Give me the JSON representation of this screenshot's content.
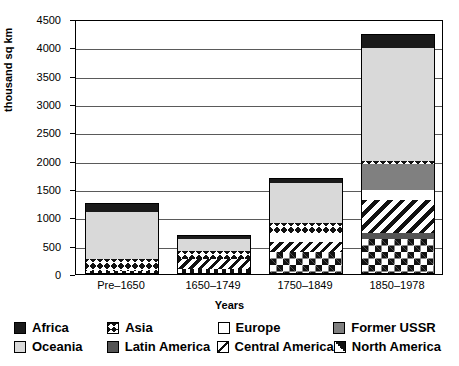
{
  "chart_data": {
    "type": "bar",
    "variant": "stacked",
    "title": "",
    "xlabel": "Years",
    "ylabel": "thousand sq km",
    "categories": [
      "Pre–1650",
      "1650–1749",
      "1750–1849",
      "1850–1978"
    ],
    "ylim": [
      0,
      4500
    ],
    "yticks": [
      0,
      500,
      1000,
      1500,
      2000,
      2500,
      3000,
      3500,
      4000,
      4500
    ],
    "ytick_labels": [
      "0",
      "500",
      "1000",
      "1500",
      "2000",
      "2500",
      "3000",
      "3500",
      "4000",
      "4500"
    ],
    "grid": true,
    "grid_axis": "y",
    "legend_position": "bottom",
    "series": [
      {
        "name": "North America",
        "pattern": "diamond-lattice",
        "values": [
          60,
          80,
          390,
          620
        ]
      },
      {
        "name": "Latin America",
        "pattern": "dark-gray-solid",
        "values": [
          0,
          0,
          0,
          110
        ]
      },
      {
        "name": "Central America",
        "pattern": "diagonal-stripes",
        "values": [
          0,
          190,
          170,
          570
        ]
      },
      {
        "name": "Europe",
        "pattern": "white-solid",
        "values": [
          0,
          0,
          150,
          180
        ]
      },
      {
        "name": "Former USSR",
        "pattern": "mid-gray-solid",
        "values": [
          0,
          0,
          0,
          460
        ]
      },
      {
        "name": "Asia",
        "pattern": "bowtie-chain",
        "values": [
          210,
          140,
          190,
          60
        ]
      },
      {
        "name": "Oceania",
        "pattern": "light-gray-solid",
        "values": [
          820,
          200,
          710,
          1990
        ]
      },
      {
        "name": "Africa",
        "pattern": "black-solid",
        "values": [
          150,
          55,
          75,
          220
        ]
      }
    ],
    "totals": [
      1240,
      665,
      1685,
      4210
    ]
  },
  "legend": {
    "rows": [
      [
        {
          "label": "Africa",
          "swatch": "black-solid"
        },
        {
          "label": "Asia",
          "swatch": "bowtie-chain"
        },
        {
          "label": "Europe",
          "swatch": "white-solid"
        },
        {
          "label": "Former USSR",
          "swatch": "mid-gray-solid"
        }
      ],
      [
        {
          "label": "Oceania",
          "swatch": "light-gray-solid"
        },
        {
          "label": "Latin America",
          "swatch": "dark-gray-solid"
        },
        {
          "label": "Central America",
          "swatch": "diagonal-stripes"
        },
        {
          "label": "North America",
          "swatch": "diamond-lattice"
        }
      ]
    ]
  },
  "colors": {
    "africa": "#1a1a1a",
    "oceania": "#d9d9d9",
    "europe": "#ffffff",
    "former_ussr": "#808080",
    "latin_america": "#545454",
    "axis": "#000000",
    "gridline": "#5a5a5a",
    "background": "#ffffff"
  }
}
